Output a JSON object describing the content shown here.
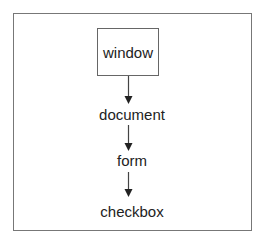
{
  "diagram": {
    "type": "hierarchy",
    "nodes": [
      {
        "id": "window",
        "label": "window",
        "boxed": true
      },
      {
        "id": "document",
        "label": "document",
        "boxed": false
      },
      {
        "id": "form",
        "label": "form",
        "boxed": false
      },
      {
        "id": "checkbox",
        "label": "checkbox",
        "boxed": false
      }
    ],
    "edges": [
      {
        "from": "window",
        "to": "document"
      },
      {
        "from": "document",
        "to": "form"
      },
      {
        "from": "form",
        "to": "checkbox"
      }
    ]
  }
}
